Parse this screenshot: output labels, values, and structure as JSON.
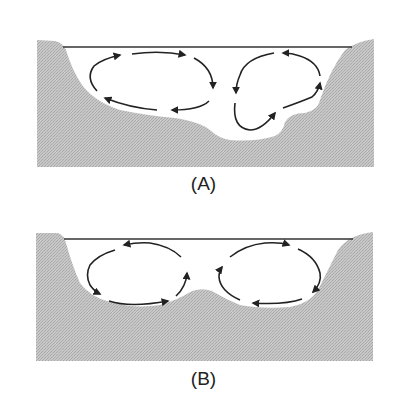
{
  "figure": {
    "panels": [
      {
        "id": "A",
        "label": "(A)",
        "description": "Asymmetric channel cross-section with two secondary circulation cells of unequal shape"
      },
      {
        "id": "B",
        "label": "(B)",
        "description": "Channel cross-section with central bar and two symmetric counter-rotating circulation cells"
      }
    ],
    "colors": {
      "bed": "#bdbdbd",
      "water": "#ffffff",
      "arrows": "#222222",
      "surface_line": "#333333"
    }
  }
}
